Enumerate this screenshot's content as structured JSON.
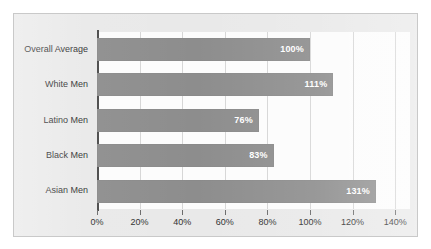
{
  "chart_data": {
    "type": "bar",
    "orientation": "horizontal",
    "title": "",
    "subtitle": "",
    "xlabel": "",
    "ylabel": "",
    "categories": [
      "Overall Average",
      "White Men",
      "Latino Men",
      "Black Men",
      "Asian Men"
    ],
    "values": [
      100,
      111,
      76,
      83,
      131
    ],
    "value_labels": [
      "100%",
      "111%",
      "76%",
      "83%",
      "131%"
    ],
    "xlim": [
      0,
      140
    ],
    "xticks": [
      0,
      20,
      40,
      60,
      80,
      100,
      120,
      140
    ],
    "xtick_labels": [
      "0%",
      "20%",
      "40%",
      "60%",
      "80%",
      "100%",
      "120%",
      "140%"
    ],
    "grid": true,
    "grid_axis": "x",
    "legend": false,
    "legend_position": "none",
    "series": [
      {
        "name": "",
        "values": [
          100,
          111,
          76,
          83,
          131
        ]
      }
    ]
  },
  "style": {
    "bar_color": "#8d8d8d",
    "plot_background": "#fcfcfc",
    "frame_background": "#e9e9e9",
    "frame_border": "#c9c9c9",
    "gridline_color": "#d6d6d6",
    "axis_color": "#4a4a4a",
    "label_color": "#2f2f2f",
    "value_label_color": "#ffffff"
  }
}
